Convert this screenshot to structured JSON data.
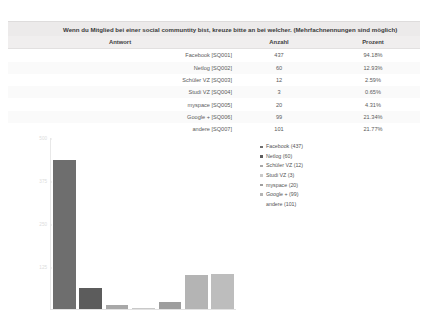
{
  "question": {
    "title": "Wenn du Mitglied bei einer social communtity bist, kreuze bitte an bei welcher. (Mehrfachnennungen sind möglich)"
  },
  "table": {
    "headers": {
      "answer": "Antwort",
      "count": "Anzahl",
      "percent": "Prozent"
    },
    "rows": [
      {
        "answer": "Facebook [SQ001]",
        "count": "437",
        "percent": "94.18%"
      },
      {
        "answer": "Netlog [SQ002]",
        "count": "60",
        "percent": "12.93%"
      },
      {
        "answer": "Schüler VZ [SQ003]",
        "count": "12",
        "percent": "2.59%"
      },
      {
        "answer": "Studi VZ [SQ004]",
        "count": "3",
        "percent": "0.65%"
      },
      {
        "answer": "myspace [SQ005]",
        "count": "20",
        "percent": "4.31%"
      },
      {
        "answer": "Google + [SQ006]",
        "count": "99",
        "percent": "21.34%"
      },
      {
        "answer": "andere [SQ007]",
        "count": "101",
        "percent": "21.77%"
      }
    ]
  },
  "legend": {
    "items": [
      {
        "label": "Facebook (437)",
        "color": "#6e6e6e",
        "marker": true
      },
      {
        "label": "Netlog (60)",
        "color": "#5c5c5c",
        "marker": true
      },
      {
        "label": "Schüler VZ (12)",
        "color": "#a8a8a8",
        "marker": true
      },
      {
        "label": "Studi VZ (3)",
        "color": "#c9c9c9",
        "marker": true
      },
      {
        "label": "myspace (20)",
        "color": "#9e9e9e",
        "marker": true
      },
      {
        "label": "Google + (99)",
        "color": "#b4b4b4",
        "marker": true
      },
      {
        "label": "andere (101)",
        "color": "#bdbdbd",
        "marker": false
      }
    ]
  },
  "chart_data": {
    "type": "bar",
    "title": "",
    "xlabel": "",
    "ylabel": "",
    "categories": [
      "Facebook",
      "Netlog",
      "Schüler VZ",
      "Studi VZ",
      "myspace",
      "Google +",
      "andere"
    ],
    "values": [
      437,
      60,
      12,
      3,
      20,
      99,
      101
    ],
    "colors": [
      "#6e6e6e",
      "#5c5c5c",
      "#a8a8a8",
      "#c9c9c9",
      "#9e9e9e",
      "#b4b4b4",
      "#bdbdbd"
    ],
    "ylim": [
      0,
      500
    ],
    "yticks": [
      "500",
      "375",
      "250",
      "125"
    ],
    "ytick_values": [
      500,
      375,
      250,
      125
    ],
    "grid": false,
    "legend_position": "right"
  }
}
